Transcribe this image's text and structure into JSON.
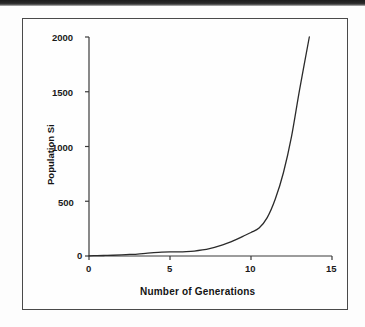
{
  "figure": {
    "scan_band_name": "scan-edge-band",
    "frame_name": "figure-border"
  },
  "chart_data": {
    "type": "line",
    "title": "",
    "xlabel": "Number of Generations",
    "ylabel": "Population Si",
    "xlim": [
      0,
      15
    ],
    "ylim": [
      0,
      2000
    ],
    "xticks": [
      "0",
      "5",
      "10",
      "15"
    ],
    "xtick_values": [
      0,
      5,
      10,
      15
    ],
    "yticks": [
      "0",
      "500",
      "1000",
      "1500",
      "2000"
    ],
    "ytick_values": [
      0,
      500,
      1000,
      1500,
      2000
    ],
    "grid": false,
    "legend": null,
    "line_color": "#2b2b2b",
    "series": [
      {
        "name": "Population Si",
        "x": [
          0,
          0.5,
          1,
          1.5,
          2,
          2.5,
          3,
          3.5,
          4,
          4.5,
          5,
          5.5,
          6,
          6.5,
          7,
          7.5,
          8,
          8.5,
          9,
          9.5,
          10,
          10.5,
          11,
          11.5,
          12,
          12.5,
          13,
          13.6
        ],
        "values": [
          2,
          3,
          5,
          7,
          10,
          14,
          18,
          24,
          30,
          35,
          38,
          38,
          40,
          45,
          55,
          70,
          90,
          115,
          145,
          180,
          215,
          255,
          350,
          520,
          760,
          1090,
          1520,
          2000
        ]
      }
    ]
  }
}
